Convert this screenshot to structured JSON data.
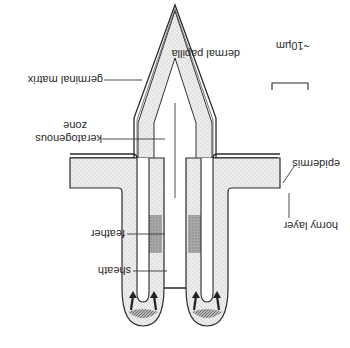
{
  "diagram": {
    "orientation": "rotated 180 degrees",
    "scale_bar": {
      "label": "~10µm"
    },
    "labels": {
      "dermal_papilla": "dermal papilla",
      "germinal_matrix": "germinal matrix",
      "keratogenous_zone_line1": "keratogenous",
      "keratogenous_zone_line2": "zone",
      "epidermis": "epidermis",
      "horny_layer": "horny layer",
      "feather": "feather",
      "sheath": "sheath"
    },
    "colors": {
      "outline": "#2a2a2a",
      "epidermis_fill": "#e6e6e6",
      "feather_fill": "#d8d8d8",
      "keratogenous_fill": "#9a9a9a",
      "matrix_fill": "#8c8c8c"
    }
  }
}
